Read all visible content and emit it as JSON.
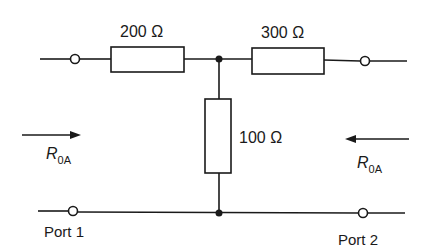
{
  "diagram": {
    "type": "two-port T-network",
    "colors": {
      "line": "#1a1a1a",
      "background": "#ffffff"
    },
    "resistors": [
      {
        "id": "R1",
        "label": "200 Ω",
        "value_ohms": 200,
        "orientation": "horizontal",
        "position": "series-left"
      },
      {
        "id": "R2",
        "label": "300 Ω",
        "value_ohms": 300,
        "orientation": "horizontal",
        "position": "series-right"
      },
      {
        "id": "R3",
        "label": "100 Ω",
        "value_ohms": 100,
        "orientation": "vertical",
        "position": "shunt"
      }
    ],
    "ports": [
      {
        "id": "port1",
        "label": "Port 1",
        "side": "left"
      },
      {
        "id": "port2",
        "label": "Port 2",
        "side": "right"
      }
    ],
    "impedance_labels": [
      {
        "side": "left",
        "symbol": "R",
        "subscript": "0A",
        "arrow_direction": "right"
      },
      {
        "side": "right",
        "symbol": "R",
        "subscript": "0A",
        "arrow_direction": "left"
      }
    ],
    "junctions": [
      {
        "id": "top-junction"
      },
      {
        "id": "bottom-junction"
      }
    ]
  }
}
